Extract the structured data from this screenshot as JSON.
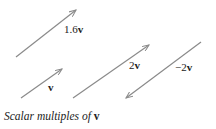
{
  "figure": {
    "caption_text": "Scalar multiples of ",
    "caption_vector": "v",
    "arrow_color": "#8a8a8a",
    "arrows": [
      {
        "name": "1.6v",
        "coef": "1.6",
        "vec": "v",
        "x1": 16,
        "y1": 57,
        "x2": 76,
        "y2": 10
      },
      {
        "name": "v",
        "coef": "",
        "vec": "v",
        "x1": 21,
        "y1": 98,
        "x2": 62,
        "y2": 69
      },
      {
        "name": "2v",
        "coef": "2",
        "vec": "v",
        "x1": 73,
        "y1": 98,
        "x2": 149,
        "y2": 45
      },
      {
        "name": "-2v",
        "coef": "−2",
        "vec": "v",
        "x1": 201,
        "y1": 42,
        "x2": 126,
        "y2": 98
      }
    ]
  }
}
